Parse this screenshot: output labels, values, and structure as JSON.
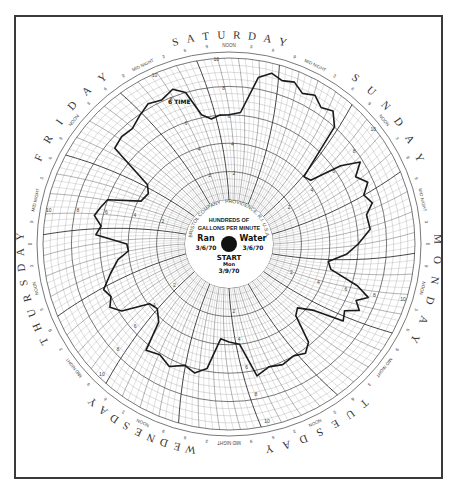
{
  "chart_data": {
    "type": "polar-line",
    "unit_label": [
      "HUNDREDS OF",
      "GALLONS PER MINUTE"
    ],
    "manufacturer_ring": "BRISTOL COMPANY · PROVIDENCE, R.I. U.S.A.",
    "handwritten": {
      "top_left": "Ran",
      "top_left_sub": "3/6/70",
      "top_right": "Water",
      "top_right_sub": "3/6/70",
      "start_label": "START",
      "start_sub": "Mon",
      "start_date": "3/9/70",
      "annotation": "6 TIME"
    },
    "days_clockwise_from_top": [
      "SATURDAY",
      "SUNDAY",
      "MONDAY",
      "TUESDAY",
      "WEDNESDAY",
      "THURSDAY",
      "FRIDAY"
    ],
    "hour_markers": [
      "MID NIGHT",
      "3",
      "6",
      "9",
      "NOON",
      "3",
      "6",
      "9"
    ],
    "radial_scale": {
      "min": 0,
      "max": 10,
      "ring_labels": [
        "10",
        "8",
        "6",
        "4",
        "2"
      ]
    },
    "series": [
      {
        "name": "Flow (hundreds of GPM)",
        "description": "Daily cycle: high flow during daytime, low flow overnight",
        "points_deg_value": [
          [
            0,
            6.0
          ],
          [
            5,
            6.2
          ],
          [
            10,
            8.8
          ],
          [
            14,
            9.3
          ],
          [
            18,
            9.0
          ],
          [
            22,
            9.2
          ],
          [
            26,
            8.7
          ],
          [
            30,
            9.0
          ],
          [
            34,
            8.5
          ],
          [
            38,
            8.8
          ],
          [
            42,
            8.0
          ],
          [
            48,
            4.0
          ],
          [
            52,
            4.2
          ],
          [
            55,
            6.5
          ],
          [
            58,
            7.8
          ],
          [
            62,
            7.0
          ],
          [
            66,
            7.6
          ],
          [
            70,
            7.0
          ],
          [
            74,
            7.4
          ],
          [
            78,
            6.8
          ],
          [
            84,
            6.9
          ],
          [
            90,
            6.0
          ],
          [
            95,
            5.2
          ],
          [
            100,
            4.0
          ],
          [
            104,
            4.3
          ],
          [
            108,
            6.4
          ],
          [
            111,
            7.4
          ],
          [
            114,
            6.7
          ],
          [
            117,
            7.2
          ],
          [
            120,
            6.3
          ],
          [
            124,
            6.6
          ],
          [
            128,
            4.5
          ],
          [
            133,
            3.5
          ],
          [
            137,
            3.8
          ],
          [
            141,
            5.8
          ],
          [
            145,
            6.3
          ],
          [
            150,
            6.0
          ],
          [
            156,
            6.2
          ],
          [
            162,
            6.0
          ],
          [
            168,
            6.4
          ],
          [
            174,
            4.0
          ],
          [
            180,
            3.8
          ],
          [
            185,
            3.6
          ],
          [
            190,
            5.8
          ],
          [
            195,
            6.3
          ],
          [
            200,
            6.0
          ],
          [
            206,
            6.5
          ],
          [
            212,
            6.1
          ],
          [
            218,
            6.4
          ],
          [
            222,
            4.3
          ],
          [
            228,
            3.7
          ],
          [
            233,
            3.9
          ],
          [
            238,
            5.8
          ],
          [
            242,
            6.4
          ],
          [
            246,
            6.0
          ],
          [
            250,
            6.3
          ],
          [
            256,
            5.5
          ],
          [
            262,
            4.8
          ],
          [
            266,
            4.0
          ],
          [
            270,
            4.1
          ],
          [
            274,
            6.3
          ],
          [
            278,
            6.0
          ],
          [
            282,
            6.6
          ],
          [
            286,
            6.3
          ],
          [
            290,
            6.0
          ],
          [
            296,
            3.8
          ],
          [
            302,
            3.6
          ],
          [
            306,
            4.0
          ],
          [
            310,
            7.4
          ],
          [
            315,
            7.6
          ],
          [
            320,
            7.5
          ],
          [
            325,
            7.9
          ],
          [
            330,
            8.3
          ],
          [
            335,
            8.1
          ],
          [
            340,
            8.5
          ],
          [
            344,
            8.0
          ],
          [
            348,
            6.2
          ],
          [
            352,
            5.8
          ],
          [
            356,
            6.0
          ],
          [
            360,
            6.0
          ]
        ]
      }
    ],
    "colors": {
      "trace": "#1a1a1a",
      "grid": "#555555",
      "grid_fine": "#9a9a9a",
      "frame": "#3a3a3a",
      "hub": "#111111"
    }
  }
}
